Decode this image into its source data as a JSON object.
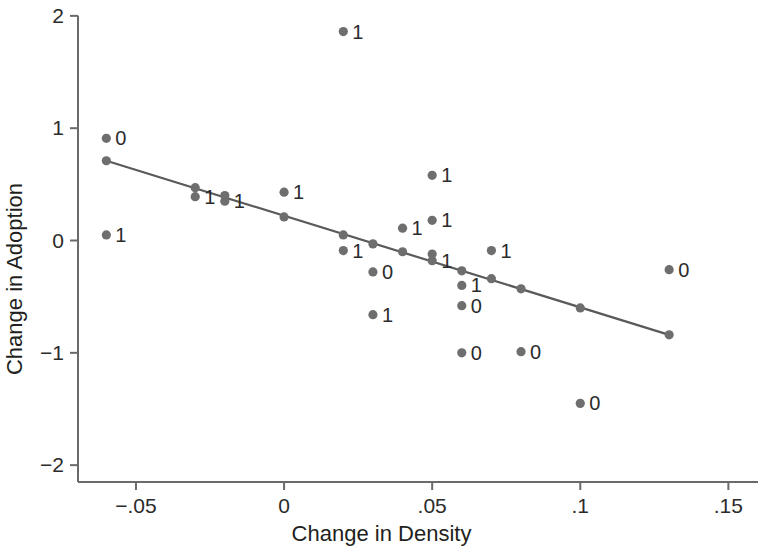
{
  "chart_data": {
    "type": "scatter",
    "title": "",
    "xlabel": "Change in Density",
    "ylabel": "Change in Adoption",
    "xlim": [
      -0.06957,
      0.16
    ],
    "ylim": [
      -2.15,
      2.07
    ],
    "xticks": [
      -0.05,
      0,
      0.05,
      0.1,
      0.15
    ],
    "xticklabels": [
      "−.05",
      "0",
      ".05",
      ".1",
      ".15"
    ],
    "yticks": [
      2,
      1,
      0,
      -1,
      -2
    ],
    "yticklabels": [
      "2",
      "1",
      "0",
      "−1",
      "−2"
    ],
    "grid": false,
    "legend": null,
    "marker_color": "#6e6e6e",
    "line_color": "#5a5a5a",
    "axis_color": "#6a6a6a",
    "points": [
      {
        "x": -0.06,
        "y": 0.91,
        "label": "0",
        "label_side": "right"
      },
      {
        "x": -0.06,
        "y": 0.71,
        "label": "",
        "label_side": "right"
      },
      {
        "x": -0.06,
        "y": 0.05,
        "label": "1",
        "label_side": "right"
      },
      {
        "x": -0.03,
        "y": 0.47,
        "label": "",
        "label_side": "right"
      },
      {
        "x": -0.03,
        "y": 0.39,
        "label": "1",
        "label_side": "right"
      },
      {
        "x": -0.02,
        "y": 0.4,
        "label": "",
        "label_side": "right"
      },
      {
        "x": -0.02,
        "y": 0.35,
        "label": "1",
        "label_side": "right"
      },
      {
        "x": 0.0,
        "y": 0.43,
        "label": "1",
        "label_side": "right"
      },
      {
        "x": 0.0,
        "y": 0.21,
        "label": "",
        "label_side": "right"
      },
      {
        "x": 0.02,
        "y": 1.86,
        "label": "1",
        "label_side": "right"
      },
      {
        "x": 0.02,
        "y": 0.05,
        "label": "",
        "label_side": "right"
      },
      {
        "x": 0.02,
        "y": -0.09,
        "label": "1",
        "label_side": "right"
      },
      {
        "x": 0.03,
        "y": -0.03,
        "label": "",
        "label_side": "right"
      },
      {
        "x": 0.03,
        "y": -0.28,
        "label": "0",
        "label_side": "right"
      },
      {
        "x": 0.03,
        "y": -0.66,
        "label": "1",
        "label_side": "right"
      },
      {
        "x": 0.04,
        "y": -0.1,
        "label": "",
        "label_side": "right"
      },
      {
        "x": 0.04,
        "y": 0.11,
        "label": "1",
        "label_side": "right"
      },
      {
        "x": 0.05,
        "y": 0.58,
        "label": "1",
        "label_side": "right"
      },
      {
        "x": 0.05,
        "y": 0.18,
        "label": "1",
        "label_side": "right"
      },
      {
        "x": 0.05,
        "y": -0.12,
        "label": "",
        "label_side": "right"
      },
      {
        "x": 0.05,
        "y": -0.18,
        "label": "1",
        "label_side": "right"
      },
      {
        "x": 0.06,
        "y": -0.27,
        "label": "",
        "label_side": "right"
      },
      {
        "x": 0.06,
        "y": -0.4,
        "label": "1",
        "label_side": "right"
      },
      {
        "x": 0.06,
        "y": -0.58,
        "label": "0",
        "label_side": "right"
      },
      {
        "x": 0.06,
        "y": -1.0,
        "label": "0",
        "label_side": "right"
      },
      {
        "x": 0.07,
        "y": -0.09,
        "label": "1",
        "label_side": "right"
      },
      {
        "x": 0.07,
        "y": -0.34,
        "label": "",
        "label_side": "right"
      },
      {
        "x": 0.08,
        "y": -0.43,
        "label": "",
        "label_side": "right"
      },
      {
        "x": 0.08,
        "y": -0.99,
        "label": "0",
        "label_side": "right"
      },
      {
        "x": 0.1,
        "y": -0.6,
        "label": "",
        "label_side": "right"
      },
      {
        "x": 0.1,
        "y": -1.45,
        "label": "0",
        "label_side": "right"
      },
      {
        "x": 0.13,
        "y": -0.84,
        "label": "",
        "label_side": "right"
      },
      {
        "x": 0.13,
        "y": -0.26,
        "label": "0",
        "label_side": "right"
      }
    ],
    "fit_line": {
      "x0": -0.06,
      "y0": 0.71,
      "x1": 0.13,
      "y1": -0.84
    }
  }
}
